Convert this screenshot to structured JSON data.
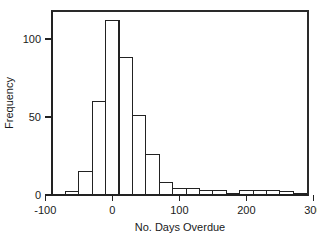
{
  "chart_data": {
    "type": "bar",
    "title": "",
    "subtitle": "",
    "xlabel": "No. Days Overdue",
    "ylabel": "Frequency",
    "xlim": [
      -90,
      292
    ],
    "ylim": [
      0,
      118
    ],
    "grid": false,
    "legend": null,
    "bin_width": 20,
    "bin_edges": [
      -70,
      -50,
      -30,
      -10,
      10,
      30,
      50,
      70,
      90,
      110,
      130,
      150,
      170,
      190,
      210,
      230,
      250,
      270,
      290
    ],
    "categories": [
      "-70 to -50",
      "-50 to -30",
      "-30 to -10",
      "-10 to 10",
      "10 to 30",
      "30 to 50",
      "50 to 70",
      "70 to 90",
      "90 to 110",
      "110 to 130",
      "130 to 150",
      "150 to 170",
      "170 to 190",
      "190 to 210",
      "210 to 230",
      "230 to 250",
      "250 to 270",
      "270 to 290"
    ],
    "values": [
      2,
      15,
      60,
      112,
      88,
      51,
      26,
      8,
      4,
      4,
      3,
      3,
      1,
      3,
      3,
      3,
      2,
      1
    ],
    "x_ticks": [
      -100,
      0,
      100,
      200,
      300
    ],
    "x_tick_labels": [
      "-100",
      "0",
      "100",
      "200",
      "300"
    ],
    "y_ticks": [
      0,
      50,
      100
    ],
    "y_tick_labels": [
      "0",
      "50",
      "100"
    ],
    "series": [
      {
        "name": "Frequency",
        "values": [
          2,
          15,
          60,
          112,
          88,
          51,
          26,
          8,
          4,
          4,
          3,
          3,
          1,
          3,
          3,
          3,
          2,
          1
        ]
      }
    ],
    "colors": {
      "bar_fill": "#ffffff",
      "bar_stroke": "#222222",
      "axis": "#222222",
      "text": "#1a1a1a",
      "background": "#ffffff"
    }
  },
  "plot_box": {
    "left": 52,
    "right": 308,
    "top": 11,
    "bottom": 195
  }
}
